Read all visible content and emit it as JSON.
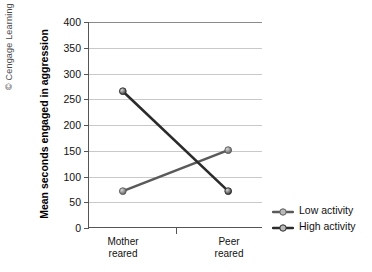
{
  "credit": "© Cengage Learning 2013",
  "legend": {
    "position": "right",
    "items": [
      {
        "label": "Low activity",
        "color": "#5a5a5a"
      },
      {
        "label": "High activity",
        "color": "#2b2b2b"
      }
    ]
  },
  "axes": {
    "ylabel": "Mean seconds engaged in aggression",
    "yticks": [
      "0",
      "50",
      "100",
      "150",
      "200",
      "250",
      "300",
      "350",
      "400"
    ],
    "xcats": [
      "Mother\nreared",
      "Peer\nreared"
    ],
    "xcat_lines": [
      [
        "Mother",
        "reared"
      ],
      [
        "Peer",
        "reared"
      ]
    ]
  },
  "chart_data": {
    "type": "line",
    "title": "",
    "xlabel": "",
    "ylabel": "Mean seconds engaged in aggression",
    "categories": [
      "Mother reared",
      "Peer reared"
    ],
    "series": [
      {
        "name": "Low activity",
        "values": [
          70,
          150
        ],
        "color": "#5a5a5a"
      },
      {
        "name": "High activity",
        "values": [
          265,
          70
        ],
        "color": "#2b2b2b"
      }
    ],
    "ylim": [
      0,
      400
    ],
    "ytick_step": 50,
    "grid": "horizontal",
    "legend_position": "right",
    "annotations": [
      "© Cengage Learning 2013"
    ]
  }
}
